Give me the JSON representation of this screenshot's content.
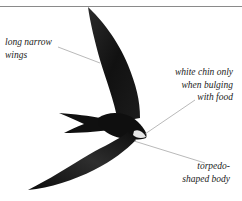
{
  "figure": {
    "colors": {
      "bird": "#141414",
      "chin": "#e8e8e8",
      "leader_line": "#8a8a8a",
      "rule": "#8a8a8a",
      "text": "#222222"
    }
  },
  "labels": {
    "wings": {
      "lines": [
        "long narrow",
        "wings"
      ]
    },
    "chin": {
      "lines": [
        "white chin only",
        "when bulging",
        "with food"
      ]
    },
    "body": {
      "lines": [
        "torpedo-",
        "shaped body"
      ]
    }
  }
}
